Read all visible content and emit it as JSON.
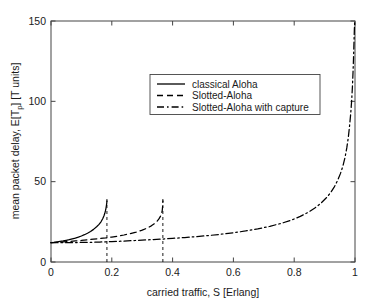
{
  "chart_data": {
    "type": "line",
    "title": "",
    "xlabel": "carried traffic, S [Erlang]",
    "ylabel": "mean packet delay, E[Tp] [T units]",
    "ylabel_parts": {
      "main": "mean packet delay, E[T",
      "sub": "p",
      "tail": "] [T units]"
    },
    "xlim": [
      0,
      1
    ],
    "ylim": [
      0,
      150
    ],
    "xticks": [
      "0",
      "0.2",
      "0.4",
      "0.6",
      "0.8",
      "1"
    ],
    "xtick_values": [
      0,
      0.2,
      0.4,
      0.6,
      0.8,
      1
    ],
    "yticks": [
      "0",
      "50",
      "100",
      "150"
    ],
    "ytick_values": [
      0,
      50,
      100,
      150
    ],
    "grid": false,
    "legend_position": "upper center",
    "line_color": "#000000",
    "series": [
      {
        "name": "classical Aloha",
        "style": "solid",
        "asymptote_x": 0.184,
        "points": [
          [
            0.0,
            12.0
          ],
          [
            0.01,
            12.2
          ],
          [
            0.02,
            12.5
          ],
          [
            0.03,
            12.8
          ],
          [
            0.04,
            13.1
          ],
          [
            0.05,
            13.5
          ],
          [
            0.06,
            13.9
          ],
          [
            0.07,
            14.4
          ],
          [
            0.08,
            14.9
          ],
          [
            0.09,
            15.5
          ],
          [
            0.1,
            16.2
          ],
          [
            0.11,
            17.0
          ],
          [
            0.12,
            17.9
          ],
          [
            0.13,
            19.0
          ],
          [
            0.14,
            20.3
          ],
          [
            0.15,
            21.9
          ],
          [
            0.158,
            23.4
          ],
          [
            0.165,
            25.2
          ],
          [
            0.17,
            26.9
          ],
          [
            0.174,
            28.6
          ],
          [
            0.177,
            30.3
          ],
          [
            0.179,
            31.8
          ],
          [
            0.181,
            33.6
          ],
          [
            0.1825,
            35.4
          ],
          [
            0.1835,
            36.8
          ],
          [
            0.184,
            38.0
          ]
        ]
      },
      {
        "name": "Slotted-Aloha",
        "style": "dashed",
        "asymptote_x": 0.368,
        "points": [
          [
            0.0,
            12.0
          ],
          [
            0.02,
            12.2
          ],
          [
            0.04,
            12.5
          ],
          [
            0.06,
            12.8
          ],
          [
            0.08,
            13.1
          ],
          [
            0.1,
            13.4
          ],
          [
            0.12,
            13.8
          ],
          [
            0.14,
            14.2
          ],
          [
            0.16,
            14.6
          ],
          [
            0.18,
            15.0
          ],
          [
            0.2,
            15.5
          ],
          [
            0.22,
            16.1
          ],
          [
            0.24,
            16.8
          ],
          [
            0.26,
            17.6
          ],
          [
            0.28,
            18.6
          ],
          [
            0.3,
            19.8
          ],
          [
            0.315,
            21.0
          ],
          [
            0.33,
            22.5
          ],
          [
            0.34,
            23.8
          ],
          [
            0.348,
            25.2
          ],
          [
            0.355,
            26.8
          ],
          [
            0.36,
            28.4
          ],
          [
            0.364,
            30.4
          ],
          [
            0.366,
            32.2
          ],
          [
            0.367,
            34.2
          ],
          [
            0.3678,
            36.5
          ],
          [
            0.3682,
            38.0
          ]
        ]
      },
      {
        "name": "Slotted-Aloha with capture",
        "style": "dashdot",
        "asymptote_x": 1.0,
        "points": [
          [
            0.0,
            12.0
          ],
          [
            0.04,
            12.0
          ],
          [
            0.08,
            12.1
          ],
          [
            0.12,
            12.2
          ],
          [
            0.16,
            12.4
          ],
          [
            0.2,
            12.7
          ],
          [
            0.24,
            13.0
          ],
          [
            0.28,
            13.4
          ],
          [
            0.32,
            13.8
          ],
          [
            0.36,
            14.2
          ],
          [
            0.4,
            14.7
          ],
          [
            0.44,
            15.2
          ],
          [
            0.48,
            15.8
          ],
          [
            0.52,
            16.5
          ],
          [
            0.56,
            17.3
          ],
          [
            0.6,
            18.2
          ],
          [
            0.64,
            19.3
          ],
          [
            0.68,
            20.6
          ],
          [
            0.72,
            22.2
          ],
          [
            0.76,
            24.2
          ],
          [
            0.79,
            26.0
          ],
          [
            0.82,
            28.4
          ],
          [
            0.845,
            30.8
          ],
          [
            0.868,
            33.6
          ],
          [
            0.888,
            36.6
          ],
          [
            0.905,
            39.8
          ],
          [
            0.92,
            43.2
          ],
          [
            0.932,
            46.8
          ],
          [
            0.943,
            50.8
          ],
          [
            0.952,
            55.0
          ],
          [
            0.96,
            59.6
          ],
          [
            0.967,
            65.0
          ],
          [
            0.973,
            71.0
          ],
          [
            0.978,
            77.5
          ],
          [
            0.982,
            84.5
          ],
          [
            0.986,
            92.5
          ],
          [
            0.989,
            100.5
          ],
          [
            0.9915,
            109.0
          ],
          [
            0.9935,
            118.0
          ],
          [
            0.995,
            126.0
          ],
          [
            0.9962,
            133.5
          ],
          [
            0.9972,
            140.0
          ],
          [
            0.998,
            145.0
          ],
          [
            0.9988,
            149.0
          ],
          [
            0.9993,
            150.0
          ]
        ]
      }
    ],
    "asymptote_lines": [
      {
        "x": 0.184,
        "style": "dashed",
        "for": "classical Aloha"
      },
      {
        "x": 0.368,
        "style": "dashed",
        "for": "Slotted-Aloha"
      }
    ]
  },
  "legend": {
    "items": [
      {
        "label": "classical Aloha",
        "style": "solid"
      },
      {
        "label": "Slotted-Aloha",
        "style": "dashed"
      },
      {
        "label": "Slotted-Aloha with capture",
        "style": "dashdot"
      }
    ]
  }
}
